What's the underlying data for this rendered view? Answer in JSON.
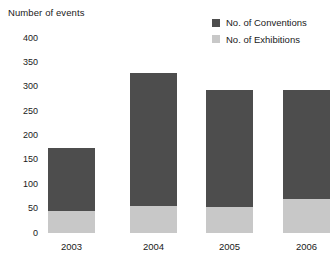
{
  "chart_data": {
    "type": "bar",
    "subtype": "stacked-vertical",
    "title": "",
    "ylabel": "Number of events",
    "xlabel": "",
    "categories": [
      "2003",
      "2004",
      "2005",
      "2006"
    ],
    "ylim": [
      0,
      400
    ],
    "yticks": [
      0,
      50,
      100,
      150,
      200,
      250,
      300,
      350,
      400
    ],
    "ytick_labels": [
      "0",
      "50",
      "100",
      "150",
      "200",
      "250",
      "300",
      "350",
      "400"
    ],
    "grid": false,
    "legend_position": "top-right",
    "series": [
      {
        "name": "No. of Conventions",
        "color": "#4d4d4d",
        "values": [
          129,
          273,
          240,
          223
        ]
      },
      {
        "name": "No. of Exhibitions",
        "color": "#c8c8c8",
        "values": [
          45,
          55,
          53,
          70
        ]
      }
    ],
    "totals": [
      174,
      328,
      293,
      293
    ]
  },
  "legend": {
    "items": [
      {
        "label": "No. of Conventions",
        "color": "#4d4d4d",
        "swatch_name": "legend-swatch-conventions"
      },
      {
        "label": "No. of Exhibitions",
        "color": "#c8c8c8",
        "swatch_name": "legend-swatch-exhibitions"
      }
    ]
  }
}
